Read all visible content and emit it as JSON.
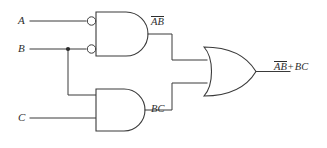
{
  "diagram": {
    "type": "logic-gate-schematic",
    "background_color": "#ffffff",
    "line_color": "#3a3a3a",
    "text_color": "#2e2e2e"
  },
  "inputs": [
    {
      "id": "A",
      "label": "A",
      "y": 21
    },
    {
      "id": "B",
      "label": "B",
      "y": 49
    },
    {
      "id": "C",
      "label": "C",
      "y": 118
    }
  ],
  "gates": [
    {
      "id": "gate1",
      "kind": "and-with-inverted-inputs",
      "shape": "and-gate",
      "inverted_inputs": true,
      "bubble_count": 2,
      "input_signals": [
        "A",
        "B"
      ],
      "output_label_plain": "AB",
      "output_label_overbar": "AB",
      "output_label_text": "ĀB̄"
    },
    {
      "id": "gate2",
      "kind": "and",
      "shape": "and-gate",
      "inverted_inputs": false,
      "bubble_count": 0,
      "input_signals": [
        "B",
        "C"
      ],
      "output_label_plain": "BC",
      "output_label_overbar": "",
      "output_label_text": "BC"
    },
    {
      "id": "gate3",
      "kind": "or",
      "shape": "or-gate",
      "inverted_inputs": false,
      "bubble_count": 0,
      "input_signals": [
        "AB",
        "BC"
      ],
      "output_label_plain": "AB + BC",
      "output_label_text": "ĀB̄ + BC"
    }
  ],
  "labels": {
    "nand_output": {
      "overbar_part": "AB",
      "plain_part": ""
    },
    "and_output": {
      "overbar_part": "",
      "plain_part": "BC"
    },
    "final_output": {
      "overbar_part": "AB",
      "operator": "+",
      "plain_part": "BC"
    }
  },
  "nodes": [
    {
      "id": "b-junction",
      "type": "wire-junction",
      "x": 68,
      "y": 49
    }
  ]
}
